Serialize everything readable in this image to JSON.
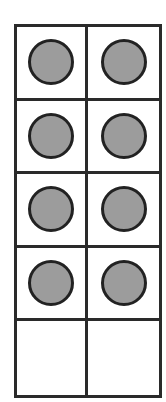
{
  "ten_frame": {
    "rows": 5,
    "columns": 2,
    "filled_count": 8,
    "empty_count": 2,
    "counter_color": "#9c9c9c",
    "line_color": "#2a2a2a",
    "cells": [
      {
        "row": 0,
        "col": 0,
        "filled": true
      },
      {
        "row": 0,
        "col": 1,
        "filled": true
      },
      {
        "row": 1,
        "col": 0,
        "filled": true
      },
      {
        "row": 1,
        "col": 1,
        "filled": true
      },
      {
        "row": 2,
        "col": 0,
        "filled": true
      },
      {
        "row": 2,
        "col": 1,
        "filled": true
      },
      {
        "row": 3,
        "col": 0,
        "filled": true
      },
      {
        "row": 3,
        "col": 1,
        "filled": true
      },
      {
        "row": 4,
        "col": 0,
        "filled": false
      },
      {
        "row": 4,
        "col": 1,
        "filled": false
      }
    ]
  }
}
